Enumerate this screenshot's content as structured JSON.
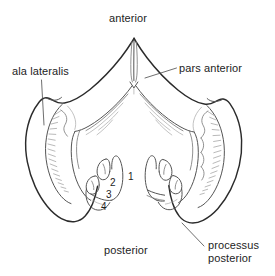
{
  "figure": {
    "type": "anatomical-line-drawing",
    "background_color": "#ffffff",
    "outline_color": "#2b2b2b",
    "inner_line_color": "#7d7d7d",
    "text_color": "#1d1d1d",
    "width": 275,
    "height": 276
  },
  "labels": {
    "anterior": "anterior",
    "posterior": "posterior",
    "ala_lateralis": "ala lateralis",
    "pars_anterior": "pars anterior",
    "processus_posterior_line1": "processus",
    "processus_posterior_line2": "posterior"
  },
  "numerals": [
    {
      "id": "1",
      "text": "1"
    },
    {
      "id": "2",
      "text": "2"
    },
    {
      "id": "3",
      "text": "3"
    },
    {
      "id": "4",
      "text": "4"
    }
  ]
}
